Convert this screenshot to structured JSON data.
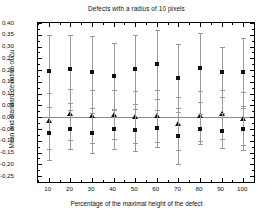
{
  "chart_data": {
    "type": "scatter",
    "title": "Defects with a radius of 10 pixels",
    "xlabel": "Percentage of the maximal height of the defect",
    "ylabel": "Mean and standard deviation of Δu",
    "xlim": [
      5,
      105
    ],
    "ylim": [
      -0.275,
      0.4
    ],
    "grid": false,
    "legend": "none",
    "zero_reference_line": true,
    "x_ticks": [
      10,
      20,
      30,
      40,
      50,
      60,
      70,
      80,
      90,
      100
    ],
    "y_ticks": [
      "0,40",
      "0,35",
      "0,30",
      "0,25",
      "0,20",
      "0,15",
      "0,10",
      "0,05",
      "0,00",
      "-0,05",
      "-0,10",
      "-0,15",
      "-0,20",
      "-0,25"
    ],
    "y_tick_values": [
      0.4,
      0.35,
      0.3,
      0.25,
      0.2,
      0.15,
      0.1,
      0.05,
      0.0,
      -0.05,
      -0.1,
      -0.15,
      -0.2,
      -0.25
    ],
    "categories": [
      10,
      20,
      30,
      40,
      50,
      60,
      70,
      80,
      90,
      100
    ],
    "series": [
      {
        "name": "upper-mean-square",
        "marker": "square",
        "values": [
          0.198,
          0.206,
          0.192,
          0.175,
          0.203,
          0.224,
          0.167,
          0.211,
          0.191,
          0.191
        ],
        "errors": [
          0.153,
          0.144,
          0.151,
          0.14,
          0.148,
          0.148,
          0.145,
          0.148,
          0.105,
          0.145
        ]
      },
      {
        "name": "middle-mean-triangle",
        "marker": "triangle",
        "values": [
          -0.016,
          0.012,
          0.004,
          0.011,
          0.002,
          0.005,
          -0.027,
          0.006,
          0.012,
          -0.007
        ],
        "errors": [
          0.118,
          0.108,
          0.112,
          0.105,
          0.11,
          0.112,
          0.112,
          0.107,
          0.103,
          0.112
        ]
      },
      {
        "name": "lower-mean-square",
        "marker": "square",
        "values": [
          -0.069,
          -0.051,
          -0.066,
          -0.051,
          -0.055,
          -0.047,
          -0.079,
          -0.051,
          -0.057,
          -0.051
        ],
        "errors": [
          0.113,
          0.082,
          0.086,
          0.082,
          0.088,
          0.078,
          0.12,
          0.063,
          0.075,
          0.09
        ]
      }
    ]
  }
}
